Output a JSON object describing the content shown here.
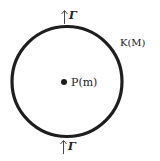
{
  "diagram": {
    "ring_label": "K(M)",
    "center_label": "P(m)",
    "top_label": "Γ",
    "bottom_label": "Γ",
    "colors": {
      "stroke": "#1e1e1e",
      "background": "#ffffff"
    }
  }
}
